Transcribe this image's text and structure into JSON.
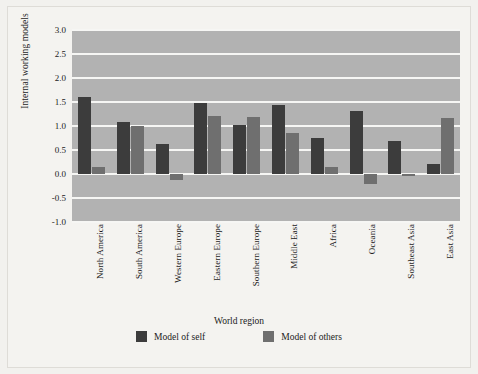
{
  "chart_data": {
    "type": "bar",
    "title": "",
    "xlabel": "World region",
    "ylabel": "Internal working models",
    "ylim": [
      -1.0,
      3.0
    ],
    "ytick_labels": [
      "3.0",
      "2.5",
      "2.0",
      "1.5",
      "1.0",
      "0.5",
      "0.0",
      "-0.5",
      "-1.0"
    ],
    "ytick_values": [
      3.0,
      2.5,
      2.0,
      1.5,
      1.0,
      0.5,
      0.0,
      -0.5,
      -1.0
    ],
    "grid": true,
    "legend_position": "bottom",
    "categories": [
      "North America",
      "South America",
      "Western Europe",
      "Eastern Europe",
      "Southern Europe",
      "Middle East",
      "Africa",
      "Oceania",
      "Southeast Asia",
      "East Asia"
    ],
    "series": [
      {
        "name": "Model of self",
        "color": "#3c3c3c",
        "values": [
          1.6,
          1.09,
          0.63,
          1.48,
          1.02,
          1.43,
          0.75,
          1.32,
          0.68,
          0.21
        ]
      },
      {
        "name": "Model of others",
        "color": "#6f6f6f",
        "values": [
          0.15,
          1.0,
          -0.12,
          1.2,
          1.18,
          0.85,
          0.14,
          -0.21,
          -0.05,
          1.16
        ]
      }
    ],
    "plot_background": "#b2b2b2",
    "gridline_color": "#f6f6f4",
    "page_background": "#f2f1ee"
  }
}
